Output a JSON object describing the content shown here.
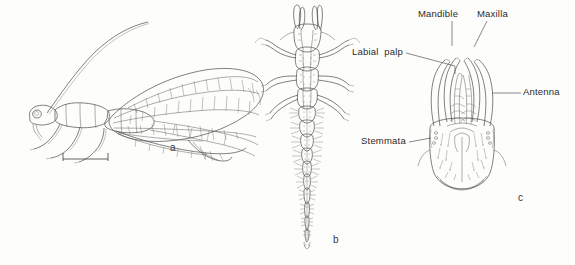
{
  "figure": {
    "background_color": "#fdfdfc",
    "ink_color": "#4a4a4a",
    "panels": [
      {
        "letter": "a",
        "name": "adult-lacewing-lateral",
        "has_scale_bar": true
      },
      {
        "letter": "b",
        "name": "larva-dorsal"
      },
      {
        "letter": "c",
        "name": "larval-head-capsule"
      }
    ]
  },
  "panel_letters": {
    "a": "a",
    "b": "b",
    "c": "c"
  },
  "annotations": {
    "labial_palp": "Labial  palp",
    "mandible": "Mandible",
    "maxilla": "Maxilla",
    "antenna": "Antenna",
    "stemmata": "Stemmata"
  }
}
